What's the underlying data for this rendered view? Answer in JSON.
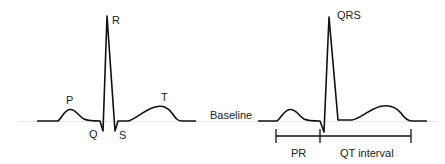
{
  "diagram": {
    "left_waveform": {
      "labels": {
        "p": "P",
        "q": "Q",
        "r": "R",
        "s": "S",
        "t": "T"
      }
    },
    "baseline_label": "Baseline",
    "right_waveform": {
      "labels": {
        "qrs": "QRS",
        "pr": "PR",
        "qt": "QT interval"
      }
    },
    "colors": {
      "trace": "#111111",
      "baseline_line": "#e6e6e6",
      "text": "#222222"
    }
  }
}
